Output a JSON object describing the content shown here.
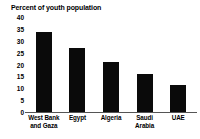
{
  "chart_data": {
    "type": "bar",
    "title": "Percent of youth population",
    "subtitle": "",
    "xlabel": "",
    "ylabel": "",
    "categories": [
      "West Bank and Gaza",
      "Egypt",
      "Algeria",
      "Saudi Arabia",
      "UAE"
    ],
    "category_lines": [
      [
        "West Bank",
        "and Gaza"
      ],
      [
        "Egypt",
        ""
      ],
      [
        "Algeria",
        ""
      ],
      [
        "Saudi",
        "Arabia"
      ],
      [
        "UAE",
        ""
      ]
    ],
    "values": [
      33.5,
      27,
      21,
      16,
      11.5
    ],
    "ylim": [
      0,
      40
    ],
    "ytick_labels": [
      "40",
      "35",
      "30",
      "25",
      "20",
      "15",
      "10",
      "5",
      "0"
    ],
    "ytick_values": [
      40,
      35,
      30,
      25,
      20,
      15,
      10,
      5,
      0
    ],
    "grid": false,
    "legend": "none",
    "bar_color": "#0a0a0a",
    "axis_color": "#555555",
    "background_color": "#ffffff"
  }
}
